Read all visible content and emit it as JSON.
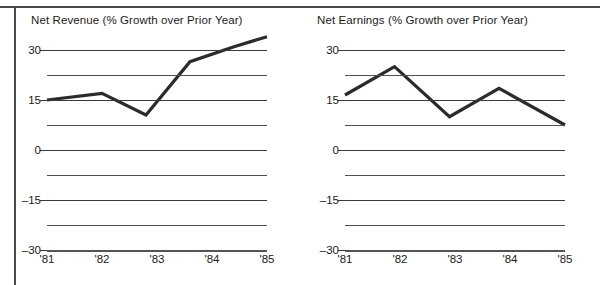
{
  "figure": {
    "background_color": "#ffffff",
    "line_color": "#2b2b2b",
    "grid_color": "#4f4f4f"
  },
  "chart_data": [
    {
      "type": "line",
      "title": "Net Revenue (% Growth over Prior Year)",
      "xlabel": "",
      "ylabel": "",
      "ylim": [
        -30,
        30
      ],
      "xlim": [
        0,
        4
      ],
      "grid": true,
      "legend": "none",
      "categories": [
        "'81",
        "'82",
        "'83",
        "'84",
        "'85"
      ],
      "yticks": [
        30,
        15,
        0,
        -15,
        -30
      ],
      "yticklabels": [
        "30",
        "15",
        "0",
        "–15",
        "–30"
      ],
      "minor_gridlines": [
        22.5,
        7.5,
        -7.5,
        -22.5
      ],
      "x": [
        0,
        1,
        1.8,
        2.6,
        3.4,
        4
      ],
      "values": [
        15,
        17,
        10.5,
        26.5,
        31,
        34
      ],
      "series": [
        {
          "name": "Net Revenue",
          "points": [
            {
              "x": 0,
              "label": "'81",
              "y": 15
            },
            {
              "x": 1,
              "label": "'82",
              "y": 17
            },
            {
              "x": 1.8,
              "label": "",
              "y": 10.5
            },
            {
              "x": 2.6,
              "label": "",
              "y": 26.5
            },
            {
              "x": 3.4,
              "label": "",
              "y": 31
            },
            {
              "x": 4,
              "label": "'85",
              "y": 34
            }
          ]
        }
      ]
    },
    {
      "type": "line",
      "title": "Net Earnings (% Growth over Prior Year)",
      "xlabel": "",
      "ylabel": "",
      "ylim": [
        -30,
        30
      ],
      "xlim": [
        0,
        4
      ],
      "grid": true,
      "legend": "none",
      "categories": [
        "'81",
        "'82",
        "'83",
        "'84",
        "'85"
      ],
      "yticks": [
        30,
        15,
        0,
        -15,
        -30
      ],
      "yticklabels": [
        "30",
        "15",
        "0",
        "–15",
        "–30"
      ],
      "minor_gridlines": [
        22.5,
        7.5,
        -7.5,
        -22.5
      ],
      "x": [
        0,
        0.9,
        1.9,
        2.8,
        4
      ],
      "values": [
        16.5,
        25,
        10,
        18.5,
        7.5
      ],
      "series": [
        {
          "name": "Net Earnings",
          "points": [
            {
              "x": 0,
              "label": "'81",
              "y": 16.5
            },
            {
              "x": 0.9,
              "label": "'82",
              "y": 25
            },
            {
              "x": 1.9,
              "label": "'83",
              "y": 10
            },
            {
              "x": 2.8,
              "label": "'84",
              "y": 18.5
            },
            {
              "x": 4,
              "label": "'85",
              "y": 7.5
            }
          ]
        }
      ]
    }
  ],
  "charts": {
    "revenue": {
      "title": "Net Revenue (% Growth over Prior Year)",
      "ylabels": [
        "30",
        "15",
        "0",
        "–15",
        "–30"
      ],
      "xlabels": [
        "'81",
        "'82",
        "'83",
        "'84",
        "'85"
      ]
    },
    "earnings": {
      "title": "Net Earnings (% Growth over Prior Year)",
      "ylabels": [
        "30",
        "15",
        "0",
        "–15",
        "–30"
      ],
      "xlabels": [
        "'81",
        "'82",
        "'83",
        "'84",
        "'85"
      ]
    }
  }
}
